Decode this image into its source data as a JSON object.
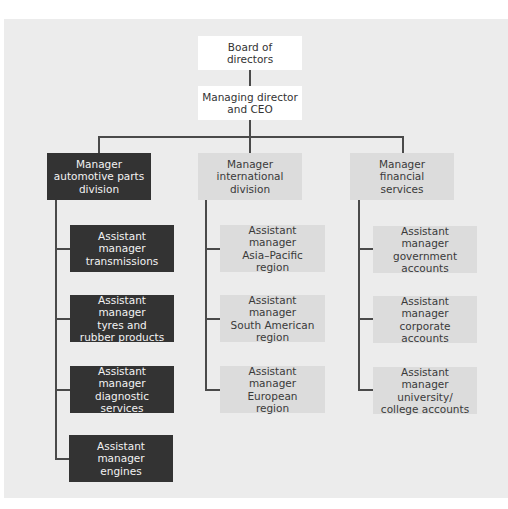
{
  "chart": {
    "top": [
      {
        "id": "board",
        "label": "Board of\ndirectors"
      },
      {
        "id": "md",
        "label": "Managing director\nand CEO"
      }
    ],
    "divisions": [
      {
        "id": "automotive",
        "label": "Manager\nautomotive parts\ndivision",
        "style": "dark",
        "children": [
          {
            "label": "Assistant\nmanager\ntransmissions"
          },
          {
            "label": "Assistant manager\ntyres and\nrubber products"
          },
          {
            "label": "Assistant manager\ndiagnostic\nservices"
          },
          {
            "label": "Assistant\nmanager\nengines"
          }
        ]
      },
      {
        "id": "international",
        "label": "Manager\ninternational\ndivision",
        "style": "light",
        "children": [
          {
            "label": "Assistant manager\nAsia–Pacific\nregion"
          },
          {
            "label": "Assistant manager\nSouth American\nregion"
          },
          {
            "label": "Assistant manager\nEuropean\nregion"
          }
        ]
      },
      {
        "id": "financial",
        "label": "Manager\nfinancial\nservices",
        "style": "light",
        "children": [
          {
            "label": "Assistant manager\ngovernment\naccounts"
          },
          {
            "label": "Assistant manager\ncorporate\naccounts"
          },
          {
            "label": "Assistant manager\nuniversity/\ncollege accounts"
          }
        ]
      }
    ],
    "colors": {
      "background": "#ececec",
      "dark_box": "#333333",
      "light_box": "#dcdcdc",
      "white_box": "#ffffff",
      "line": "#4a4a4a"
    }
  }
}
